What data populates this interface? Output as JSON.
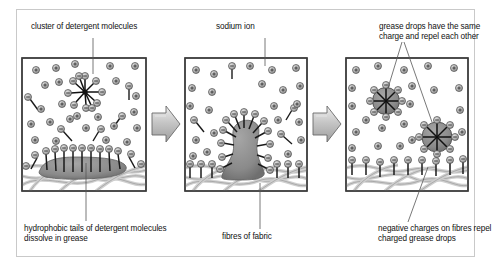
{
  "figure": {
    "title_hidden": "",
    "panel_count": 3
  },
  "captions": {
    "cluster": "cluster of detergent molecules",
    "sodium": "sodium ion",
    "repel": "grease drops have the same charge and repel each other",
    "hydrophobic": "hydrophobic tails of detergent molecules dissolve in grease",
    "fibres": "fibres of fabric",
    "negative": "negative charges on fibres repel charged grease drops"
  },
  "symbols": {
    "sodium_ion": "+",
    "detergent_head": "−"
  },
  "colors": {
    "frame": "#c9c9c9",
    "panel_border": "#3c3c3c",
    "panel_fill": "#ffffff",
    "grease": "#8f8f8f",
    "grease_dark": "#6e6e6e",
    "fibre": "#cfcfcf",
    "fibre_outline": "#9a9a9a",
    "ion_fill": "#b8b8b8",
    "ion_stroke": "#4a4a4a",
    "tail": "#1a1a1a",
    "arrow_fill": "#c2c2c2",
    "arrow_stroke": "#6a6a6a",
    "leader": "#555555",
    "text": "#111111"
  },
  "panels": [
    {
      "id": "panel-1",
      "name": "detergent-in-water-on-grease",
      "label": "cluster of detergent molecules",
      "has_micelle": true,
      "has_grease_layer": true,
      "free_sodium_ions": 22,
      "free_detergent_molecules": 5
    },
    {
      "id": "panel-2",
      "name": "grease-lifting-from-fibres",
      "label": "fibres of fabric",
      "has_grease_plume": true,
      "free_sodium_ions": 20,
      "free_detergent_molecules": 4
    },
    {
      "id": "panel-3",
      "name": "grease-drops-released",
      "label": "negative charges on fibres repel charged grease drops",
      "grease_drops": 2,
      "free_sodium_ions": 18,
      "free_detergent_molecules": 0
    }
  ],
  "arrows": [
    {
      "name": "arrow-1-to-2",
      "direction": "right"
    },
    {
      "name": "arrow-2-to-3",
      "direction": "right"
    }
  ]
}
